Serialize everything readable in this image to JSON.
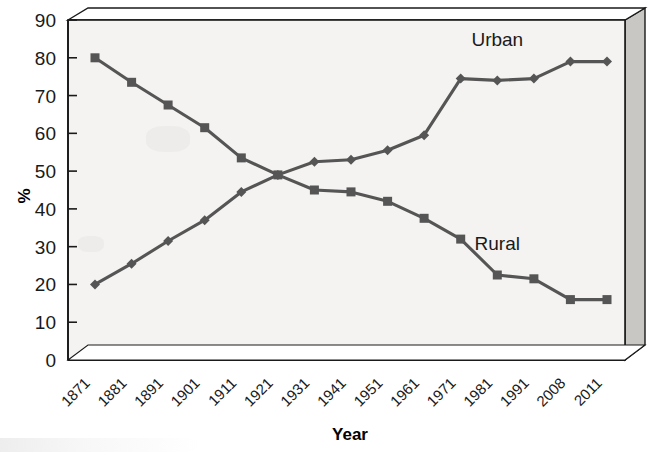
{
  "chart_data": {
    "type": "line",
    "title": "",
    "xlabel": "Year",
    "ylabel": "%",
    "ylim": [
      0,
      90
    ],
    "ytick_step": 10,
    "grid": false,
    "legend": "inline-labels",
    "categories": [
      "1871",
      "1881",
      "1891",
      "1901",
      "1911",
      "1921",
      "1931",
      "1941",
      "1951",
      "1961",
      "1971",
      "1981",
      "1991",
      "2008",
      "2011"
    ],
    "series": [
      {
        "name": "Urban",
        "marker": "diamond",
        "color": "#555555",
        "label_position": "upper-right",
        "values": [
          20,
          25.5,
          31.5,
          37,
          44.5,
          49,
          52.5,
          53,
          55.5,
          59.5,
          74.5,
          74,
          74.5,
          79,
          79
        ]
      },
      {
        "name": "Rural",
        "marker": "square",
        "color": "#555555",
        "label_position": "lower-right",
        "values": [
          80,
          73.5,
          67.5,
          61.5,
          53.5,
          49,
          45,
          44.5,
          42,
          37.5,
          32,
          22.5,
          21.5,
          16,
          16
        ]
      }
    ],
    "ytick_labels": [
      "0",
      "10",
      "20",
      "30",
      "40",
      "50",
      "60",
      "70",
      "80",
      "90"
    ],
    "annotations": [
      {
        "text": "Urban",
        "x_category": "1981",
        "y_value": 83
      },
      {
        "text": "Rural",
        "x_category": "1981",
        "y_value": 29
      }
    ]
  },
  "plot_style": {
    "frame": "3d-box",
    "plot_bg": "#f4f3f1",
    "frame_side_color": "#c9c7c4",
    "frame_top_color": "#ffffff",
    "axis_color": "#1a1a1a"
  }
}
